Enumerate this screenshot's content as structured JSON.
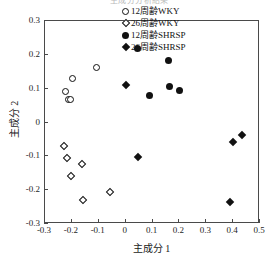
{
  "title_clipped": "主成分分析結果",
  "axes": {
    "xlabel": "主成分 1",
    "ylabel": "主成分 2",
    "xticks": [
      "-0.3",
      "-0.2",
      "-0.1",
      "0",
      "0.1",
      "0.2",
      "0.3",
      "0.4",
      "0.5"
    ],
    "yticks": [
      "0.3",
      "0.2",
      "0.1",
      "0",
      "-0.1",
      "-0.2",
      "-0.3"
    ]
  },
  "legend": {
    "items": [
      {
        "label": "12周齢WKY",
        "marker": "open-circle"
      },
      {
        "label": "26周齢WKY",
        "marker": "open-diamond"
      },
      {
        "label": "12周齢SHRSP",
        "marker": "filled-circle"
      },
      {
        "label": "26周齢SHRSP",
        "marker": "filled-diamond"
      }
    ]
  },
  "chart_data": {
    "type": "scatter",
    "title": "主成分分析結果",
    "xlabel": "主成分 1",
    "ylabel": "主成分 2",
    "xlim": [
      -0.3,
      0.5
    ],
    "ylim": [
      -0.3,
      0.3
    ],
    "xticks": [
      -0.3,
      -0.2,
      -0.1,
      0,
      0.1,
      0.2,
      0.3,
      0.4,
      0.5
    ],
    "yticks": [
      -0.3,
      -0.2,
      -0.1,
      0,
      0.1,
      0.2,
      0.3
    ],
    "grid": false,
    "legend_position": "top-right",
    "series": [
      {
        "name": "12周齢WKY",
        "marker": "open-circle",
        "color": "#111111",
        "points": [
          [
            -0.225,
            0.093
          ],
          [
            -0.211,
            0.069
          ],
          [
            -0.204,
            0.068
          ],
          [
            -0.196,
            0.13
          ],
          [
            -0.107,
            0.163
          ]
        ]
      },
      {
        "name": "26周齢WKY",
        "marker": "open-diamond",
        "color": "#111111",
        "points": [
          [
            -0.228,
            -0.069
          ],
          [
            -0.218,
            -0.105
          ],
          [
            -0.204,
            -0.159
          ],
          [
            -0.162,
            -0.122
          ],
          [
            -0.16,
            -0.23
          ],
          [
            -0.06,
            -0.205
          ]
        ]
      },
      {
        "name": "12周齢SHRSP",
        "marker": "filled-circle",
        "color": "#111111",
        "points": [
          [
            0.045,
            0.218
          ],
          [
            0.088,
            0.079
          ],
          [
            0.158,
            0.184
          ],
          [
            0.163,
            0.106
          ],
          [
            0.199,
            0.094
          ]
        ]
      },
      {
        "name": "26周齢SHRSP",
        "marker": "filled-diamond",
        "color": "#111111",
        "points": [
          [
            0.0,
            0.11
          ],
          [
            0.045,
            -0.101
          ],
          [
            0.39,
            -0.234
          ],
          [
            0.4,
            -0.058
          ],
          [
            0.433,
            -0.038
          ]
        ]
      }
    ]
  }
}
